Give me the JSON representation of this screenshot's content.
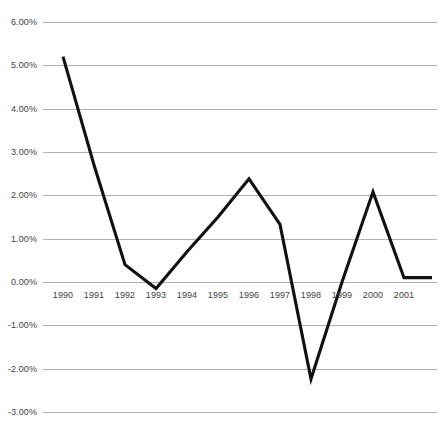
{
  "chart_data": {
    "type": "line",
    "title": "",
    "subtitle": "",
    "xlabel": "",
    "ylabel": "",
    "categories": [
      "1990",
      "1991",
      "1992",
      "1993",
      "1994",
      "1995",
      "1996",
      "1997",
      "1998",
      "1999",
      "2000",
      "2001"
    ],
    "series": [
      {
        "name": "",
        "values": [
          5.2,
          2.7,
          0.4,
          -0.15,
          0.7,
          1.5,
          2.38,
          1.33,
          -2.24,
          0.0,
          2.08,
          0.1
        ]
      }
    ],
    "trailing_value": 0.1,
    "ylim": [
      -3.0,
      6.0
    ],
    "ytick_labels": [
      "6.00%",
      "5.00%",
      "4.00%",
      "3.00%",
      "2.00%",
      "1.00%",
      "0.00%",
      "-1.00%",
      "-2.00%",
      "-3.00%"
    ],
    "ytick_values": [
      6.0,
      5.0,
      4.0,
      3.0,
      2.0,
      1.0,
      0.0,
      -1.0,
      -2.0,
      -3.0
    ],
    "value_unit": "%",
    "grid": "horizontal",
    "legend": "none",
    "colors": {
      "line": "#111111",
      "gridline": "#b0b0b0",
      "tick_text": "#3f3f3f",
      "background": "#ffffff"
    }
  }
}
